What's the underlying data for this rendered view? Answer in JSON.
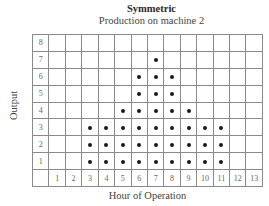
{
  "chart_data": {
    "type": "dot-plot",
    "title": "Symmetric",
    "subtitle": "Production on machine 2",
    "xlabel": "Hour of Operation",
    "ylabel": "Output",
    "x_ticks": [
      "1",
      "2",
      "3",
      "4",
      "5",
      "6",
      "7",
      "8",
      "9",
      "10",
      "11",
      "12",
      "13"
    ],
    "y_ticks": [
      "8",
      "7",
      "6",
      "5",
      "4",
      "3",
      "2",
      "1"
    ],
    "categories": [
      1,
      2,
      3,
      4,
      5,
      6,
      7,
      8,
      9,
      10,
      11,
      12,
      13
    ],
    "values": [
      0,
      0,
      3,
      3,
      4,
      6,
      7,
      6,
      4,
      3,
      3,
      0,
      0
    ],
    "ylim": [
      0,
      8
    ],
    "grid": true,
    "dot_color": "#1a1a1a",
    "grid_color": "#8a8a8a"
  }
}
